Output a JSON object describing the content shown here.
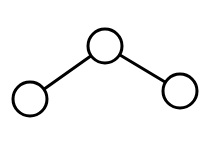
{
  "diagram": {
    "type": "tree",
    "stroke_color": "#000000",
    "fill_color": "#ffffff",
    "stroke_width": 3,
    "nodes": [
      {
        "id": "root",
        "cx": 105,
        "cy": 46,
        "r": 17
      },
      {
        "id": "left-child",
        "cx": 30,
        "cy": 99,
        "r": 17
      },
      {
        "id": "right-child",
        "cx": 180,
        "cy": 91,
        "r": 17
      }
    ],
    "edges": [
      {
        "from": "root",
        "to": "left-child"
      },
      {
        "from": "root",
        "to": "right-child"
      }
    ]
  }
}
